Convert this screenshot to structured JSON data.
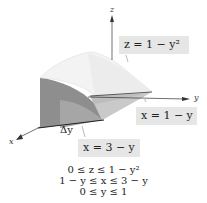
{
  "figure": {
    "axes": {
      "x": "x",
      "y": "y",
      "z": "z"
    },
    "labels": {
      "surface_top": "z = 1 − y²",
      "plane_back": "x = 1 − y",
      "plane_front": "x = 3 − y",
      "slice_width": "Δy"
    },
    "inequalities": [
      "0 ≤ z ≤ 1 − y²",
      "1 − y ≤ x ≤ 3 − y",
      "0 ≤ y ≤ 1"
    ],
    "colors": {
      "label_bg": "#e6e6e6",
      "surface_light": "#f2f2f2",
      "surface_mid": "#c8c8c8",
      "surface_dark": "#8f8f8f",
      "axis": "#333333"
    }
  }
}
